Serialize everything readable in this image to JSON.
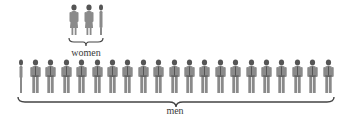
{
  "women": {
    "label": "women",
    "count": 3,
    "views": [
      "front",
      "front",
      "side"
    ]
  },
  "men": {
    "label": "men",
    "count": 21,
    "views": [
      "side",
      "front",
      "front",
      "front",
      "front",
      "front",
      "front",
      "front",
      "front",
      "front",
      "front",
      "front",
      "front",
      "front",
      "front",
      "front",
      "front",
      "front",
      "front",
      "front",
      "front"
    ]
  },
  "colors": {
    "figure": "#8a8a8a",
    "figure_dark": "#555555",
    "brace": "#444444",
    "text": "#3a3a3a"
  }
}
